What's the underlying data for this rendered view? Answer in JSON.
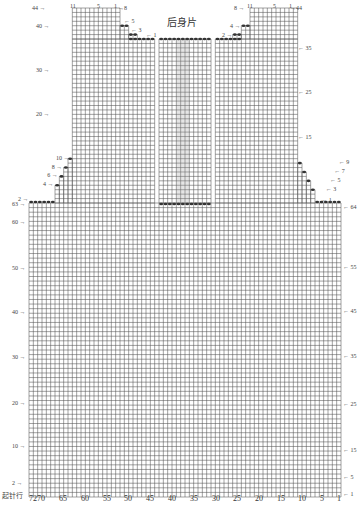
{
  "title": "后身片",
  "chart": {
    "stitches": 72,
    "body_rows": 64,
    "upper_rows": 44,
    "cast_on_label": "起针行",
    "x_tick_labels": [
      "72",
      "70",
      "65",
      "60",
      "55",
      "50",
      "45",
      "40",
      "35",
      "30",
      "25",
      "20",
      "15",
      "10",
      "5",
      "1"
    ],
    "left_row_labels": [
      "2",
      "10",
      "20",
      "30",
      "40",
      "50",
      "60",
      "63"
    ],
    "right_row_labels": [
      "1",
      "5",
      "15",
      "25",
      "35",
      "45",
      "55",
      "64"
    ],
    "left_armhole_labels": [
      "2",
      "4",
      "6",
      "8",
      "10"
    ],
    "right_armhole_labels": [
      "1",
      "3",
      "5",
      "7",
      "9"
    ],
    "left_upper_row_labels": [
      "20",
      "30",
      "40",
      "44"
    ],
    "right_upper_row_labels": [
      "15",
      "25",
      "35",
      "44"
    ],
    "left_shoulder_labels": [
      "1",
      "3",
      "5",
      "8"
    ],
    "right_shoulder_labels": [
      "2",
      "4",
      "8"
    ],
    "left_shoulder_top_cols": [
      "11",
      "5",
      "1"
    ],
    "right_shoulder_top_cols": [
      "11",
      "5",
      "1"
    ]
  }
}
